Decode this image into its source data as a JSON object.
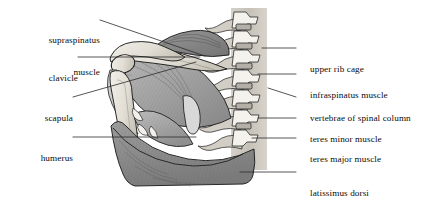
{
  "figure": {
    "background_color": "#ffffff",
    "text_color": "#0b0b0b",
    "leader_line_color": "#2b2b2b"
  },
  "labels_left": [
    {
      "id": "supraspinatus",
      "line1": "supraspinatus",
      "line2": "muscle"
    },
    {
      "id": "clavicle",
      "line1": "clavicle",
      "line2": ""
    },
    {
      "id": "scapula",
      "line1": "scapula",
      "line2": ""
    },
    {
      "id": "humerus",
      "line1": "humerus",
      "line2": ""
    }
  ],
  "labels_right": [
    {
      "id": "upper-rib-cage",
      "line1": "upper rib cage",
      "line2": ""
    },
    {
      "id": "infraspinatus-muscle",
      "line1": "infraspinatus muscle",
      "line2": ""
    },
    {
      "id": "vertebrae-spinal-column",
      "line1": "vertebrae of spinal column",
      "line2": ""
    },
    {
      "id": "teres-minor-muscle",
      "line1": "teres minor muscle",
      "line2": ""
    },
    {
      "id": "teres-major-muscle",
      "line1": "teres major muscle",
      "line2": ""
    },
    {
      "id": "latissimus-dorsi",
      "line1": "latissimus dorsi",
      "line2": "muscle (lower part)"
    }
  ],
  "palette": {
    "bone_light": "#e8e5de",
    "bone_shadow": "#cfcac0",
    "muscle_dark": "#8f8f8f",
    "muscle_mid": "#a8a8a8",
    "muscle_light": "#c2c2c2",
    "spine_band": "#cdc9c1",
    "outline": "#1d1d1d"
  }
}
